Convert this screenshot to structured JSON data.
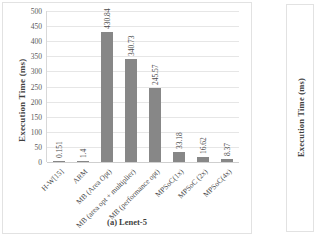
{
  "figure": {
    "caption": "(a) Lenet-5",
    "left_panel": {
      "ylabel": "Execution Time (ms)"
    },
    "right_panel": {
      "ylabel": "Execution Time (ms)"
    }
  },
  "chart_data": {
    "type": "bar",
    "title": "(a) Lenet-5",
    "xlabel": "",
    "ylabel": "Execution Time (ms)",
    "ylim": [
      0,
      500
    ],
    "ytick_step": 50,
    "yticks": [
      "0",
      "50",
      "100",
      "150",
      "200",
      "250",
      "300",
      "350",
      "400",
      "450",
      "500"
    ],
    "grid": true,
    "legend": "none",
    "bar_color": "#878787",
    "categories": [
      "H-W[15]",
      "ARM",
      "MB (Area Opt)",
      "MB (area opt + multiplier)",
      "MB (performance opt)",
      "MPSoC(1x)",
      "MPSoC (2x)",
      "MPSoC(4x)"
    ],
    "values": [
      0.151,
      1.4,
      430.84,
      340.73,
      245.57,
      33.18,
      16.62,
      8.37
    ],
    "data_labels": [
      "0.151",
      "1.4",
      "430.84",
      "340.73",
      "245.57",
      "33.18",
      "16.62",
      "8.37"
    ]
  }
}
